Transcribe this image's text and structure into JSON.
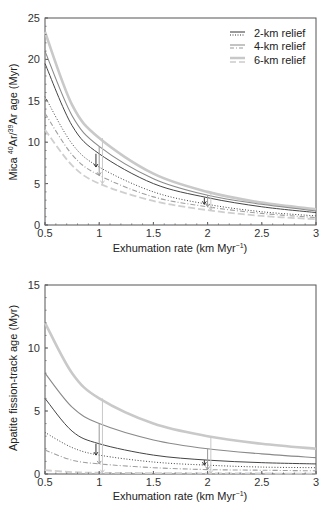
{
  "chart_data": [
    {
      "type": "line",
      "title": "",
      "xlabel": "Exhumation rate (km Myr⁻¹)",
      "ylabel": "Mica 40Ar/39Ar age (Myr)",
      "xlim": [
        0.5,
        3
      ],
      "ylim": [
        0,
        25
      ],
      "xticks": [
        "0.5",
        "1",
        "1.5",
        "2",
        "2.5",
        "3"
      ],
      "yticks": [
        "0",
        "5",
        "10",
        "15",
        "20",
        "25"
      ],
      "legend": {
        "position": "upper right",
        "entries": [
          "2-km relief",
          "4-km relief",
          "6-km relief"
        ]
      },
      "x": [
        0.5,
        0.75,
        1,
        1.5,
        2,
        2.5,
        3
      ],
      "series": [
        {
          "name": "6-km relief (upper)",
          "style": "solid-thick-light",
          "values": [
            23.3,
            14.5,
            10.5,
            6.2,
            4.0,
            2.7,
            1.9
          ]
        },
        {
          "name": "4-km relief (upper)",
          "style": "solid-mid",
          "values": [
            21.0,
            13.2,
            9.5,
            5.6,
            3.6,
            2.5,
            1.7
          ]
        },
        {
          "name": "2-km relief (upper)",
          "style": "solid-dark",
          "values": [
            19.5,
            12.0,
            8.6,
            5.0,
            3.3,
            2.2,
            1.5
          ]
        },
        {
          "name": "2-km relief (lower)",
          "style": "dotted-dark",
          "values": [
            15.5,
            9.8,
            7.0,
            4.0,
            2.5,
            1.6,
            1.1
          ]
        },
        {
          "name": "4-km relief (lower)",
          "style": "dashdot-mid",
          "values": [
            13.5,
            8.5,
            6.0,
            3.4,
            2.2,
            1.4,
            0.9
          ]
        },
        {
          "name": "6-km relief (lower)",
          "style": "dashed-light",
          "values": [
            11.5,
            7.2,
            5.0,
            2.9,
            1.8,
            1.1,
            0.7
          ]
        }
      ],
      "annotations": [
        {
          "type": "arrow",
          "x": 0.97,
          "from": 8.6,
          "to": 7.0,
          "relief": "2-km"
        },
        {
          "type": "arrow",
          "x": 1.0,
          "from": 9.5,
          "to": 6.0,
          "relief": "4-km"
        },
        {
          "type": "arrow",
          "x": 1.03,
          "from": 10.5,
          "to": 5.0,
          "relief": "6-km"
        },
        {
          "type": "arrow",
          "x": 1.97,
          "from": 3.3,
          "to": 2.5,
          "relief": "2-km"
        },
        {
          "type": "arrow",
          "x": 2.0,
          "from": 3.6,
          "to": 2.2,
          "relief": "4-km"
        },
        {
          "type": "arrow",
          "x": 2.03,
          "from": 4.0,
          "to": 1.8,
          "relief": "6-km"
        }
      ],
      "grid": false
    },
    {
      "type": "line",
      "title": "",
      "xlabel": "Exhumation rate (km Myr⁻¹)",
      "ylabel": "Apatite fission-track age (Myr)",
      "xlim": [
        0.5,
        3
      ],
      "ylim": [
        0,
        15
      ],
      "xticks": [
        "0.5",
        "1",
        "1.5",
        "2",
        "2.5",
        "3"
      ],
      "yticks": [
        "0",
        "5",
        "10",
        "15"
      ],
      "x": [
        0.5,
        0.75,
        1,
        1.5,
        2,
        2.5,
        3
      ],
      "series": [
        {
          "name": "6-km relief (upper)",
          "style": "solid-thick-light",
          "values": [
            12.0,
            8.0,
            6.0,
            4.0,
            3.0,
            2.4,
            2.0
          ]
        },
        {
          "name": "4-km relief (upper)",
          "style": "solid-mid",
          "values": [
            8.0,
            5.3,
            4.0,
            2.7,
            2.0,
            1.6,
            1.3
          ]
        },
        {
          "name": "2-km relief (upper)",
          "style": "solid-dark",
          "values": [
            6.0,
            3.4,
            2.4,
            1.5,
            1.1,
            0.9,
            0.8
          ]
        },
        {
          "name": "2-km relief (lower)",
          "style": "dotted-dark",
          "values": [
            3.3,
            2.1,
            1.5,
            0.95,
            0.7,
            0.55,
            0.5
          ]
        },
        {
          "name": "4-km relief (lower)",
          "style": "dashdot-mid",
          "values": [
            1.9,
            1.1,
            0.8,
            0.5,
            0.35,
            0.3,
            0.25
          ]
        },
        {
          "name": "6-km relief (lower)",
          "style": "dashed-light",
          "values": [
            0.3,
            0.15,
            0.1,
            0.07,
            0.05,
            0.04,
            0.03
          ]
        }
      ],
      "annotations": [
        {
          "type": "arrow",
          "x": 0.97,
          "from": 2.4,
          "to": 1.5,
          "relief": "2-km"
        },
        {
          "type": "arrow",
          "x": 1.0,
          "from": 4.0,
          "to": 0.8,
          "relief": "4-km"
        },
        {
          "type": "arrow",
          "x": 1.03,
          "from": 6.0,
          "to": 0.1,
          "relief": "6-km"
        },
        {
          "type": "arrow",
          "x": 1.97,
          "from": 1.1,
          "to": 0.7,
          "relief": "2-km"
        },
        {
          "type": "arrow",
          "x": 2.0,
          "from": 2.0,
          "to": 0.35,
          "relief": "4-km"
        },
        {
          "type": "arrow",
          "x": 2.03,
          "from": 3.0,
          "to": 0.05,
          "relief": "6-km"
        }
      ],
      "grid": false
    }
  ],
  "top": {
    "ylabel_prefix": "Mica ",
    "sup40": "40",
    "ar1": "Ar/",
    "sup39": "39",
    "ar2": "Ar age (Myr)",
    "xlabel": "Exhumation rate (km Myr",
    "xlabel_sup": "−1",
    "xlabel_end": ")"
  },
  "bottom": {
    "ylabel": "Apatite fission-track age (Myr)",
    "xlabel": "Exhumation rate (km Myr",
    "xlabel_sup": "−1",
    "xlabel_end": ")"
  },
  "legend": {
    "items": [
      {
        "label": "2-km relief"
      },
      {
        "label": "4-km relief"
      },
      {
        "label": "6-km relief"
      }
    ]
  }
}
